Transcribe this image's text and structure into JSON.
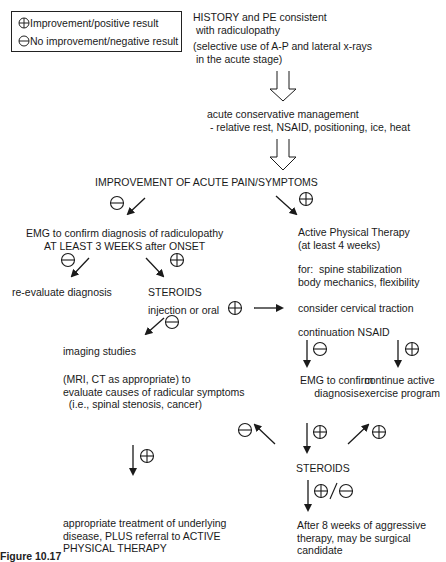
{
  "legend": {
    "positive_label": "Improvement/positive result",
    "negative_label": "No improvement/negative result",
    "positive_icon": "circle-plus-icon",
    "negative_icon": "circle-minus-icon"
  },
  "nodes": {
    "history": [
      "HISTORY and PE consistent",
      " with radiculopathy"
    ],
    "xrays": [
      "(selective use of A-P and lateral x-rays",
      " in the acute stage)"
    ],
    "acute_mgmt": [
      "acute conservative management",
      " - relative rest, NSAID, positioning, ice, heat"
    ],
    "improvement": "IMPROVEMENT OF ACUTE PAIN/SYMPTOMS",
    "emg_left": [
      "EMG to confirm diagnosis of radiculopathy",
      "AT LEAST 3 WEEKS after ONSET"
    ],
    "reevaluate": "re-evaluate diagnosis",
    "steroids_left": "STEROIDS",
    "steroids_route": "injection or oral",
    "imaging": "imaging studies",
    "imaging_detail": [
      "(MRI, CT as appropriate) to",
      "evaluate causes of radicular symptoms",
      "  (i.e., spinal stenosis, cancer)"
    ],
    "treatment": [
      "appropriate treatment of underlying",
      "disease, PLUS referral to ACTIVE",
      "PHYSICAL THERAPY"
    ],
    "active_pt": [
      "Active Physical Therapy",
      "(at least 4 weeks)"
    ],
    "for_items": [
      "for:  spine stabilization",
      "body mechanics, flexibility"
    ],
    "traction": "consider cervical traction",
    "nsaid": "continuation NSAID",
    "emg_right": [
      "EMG to confirm",
      "diagnosis"
    ],
    "exercise": [
      "continue active",
      "exercise program"
    ],
    "steroids_right": "STEROIDS",
    "surgical": [
      "After 8 weeks of aggressive",
      "therapy, may be surgical",
      "candidate"
    ]
  },
  "symbols": {
    "plus": "⊕",
    "minus": "⊖",
    "plus_minus": "⊕/⊖"
  },
  "caption": "Figure 10.17"
}
